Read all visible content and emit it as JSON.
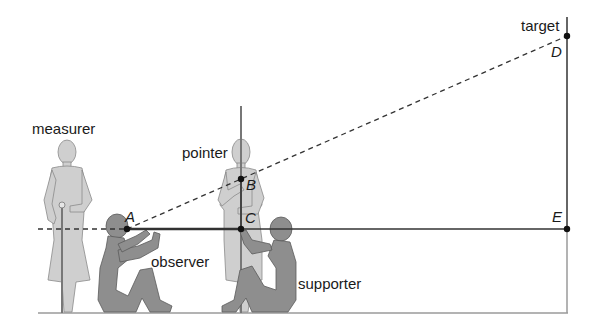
{
  "figure": {
    "labels": {
      "measurer": "measurer",
      "pointer": "pointer",
      "observer": "observer",
      "supporter": "supporter",
      "target": "target"
    },
    "points": {
      "A": "A",
      "B": "B",
      "C": "C",
      "D": "D",
      "E": "E"
    },
    "colors": {
      "light_figure": "#cfcfcf",
      "dark_figure": "#8e8e8e",
      "line": "#333333",
      "ground": "#9a9a9a"
    }
  }
}
